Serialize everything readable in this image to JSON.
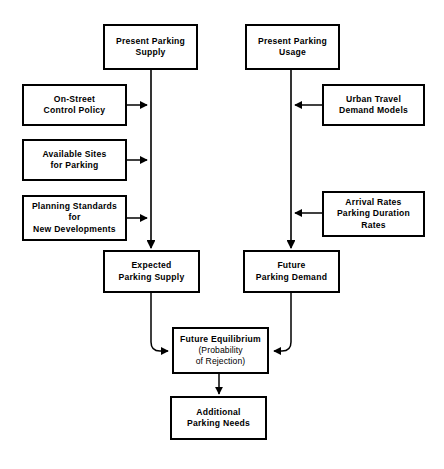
{
  "diagram": {
    "type": "flowchart",
    "background_color": "#ffffff",
    "line_color": "#000000",
    "text_color": "#000000",
    "nodes": [
      {
        "id": "present-parking-supply",
        "lines": [
          "Present Parking",
          "Supply"
        ],
        "x": 103,
        "y": 24,
        "w": 95,
        "h": 46
      },
      {
        "id": "present-parking-usage",
        "lines": [
          "Present Parking",
          "Usage"
        ],
        "x": 245,
        "y": 24,
        "w": 95,
        "h": 46
      },
      {
        "id": "on-street-control-policy",
        "lines": [
          "On-Street",
          "Control  Policy"
        ],
        "x": 22,
        "y": 84,
        "w": 105,
        "h": 42
      },
      {
        "id": "urban-travel-demand-models",
        "lines": [
          "Urban Travel",
          "Demand Models"
        ],
        "x": 322,
        "y": 84,
        "w": 103,
        "h": 42
      },
      {
        "id": "available-sites-for-parking",
        "lines": [
          "Available  Sites",
          "for Parking"
        ],
        "x": 22,
        "y": 139,
        "w": 105,
        "h": 42
      },
      {
        "id": "arrival-rates",
        "lines": [
          "Arrival Rates",
          "Parking Duration",
          "Rates"
        ],
        "x": 322,
        "y": 191,
        "w": 103,
        "h": 46
      },
      {
        "id": "planning-standards",
        "lines": [
          "Planning Standards",
          "for",
          "New Developments"
        ],
        "x": 22,
        "y": 195,
        "w": 105,
        "h": 46
      },
      {
        "id": "expected-parking-supply",
        "lines": [
          "Expected",
          "Parking  Supply"
        ],
        "x": 103,
        "y": 250,
        "w": 97,
        "h": 43
      },
      {
        "id": "future-parking-demand",
        "lines": [
          "Future",
          "Parking  Demand"
        ],
        "x": 243,
        "y": 250,
        "w": 97,
        "h": 43
      },
      {
        "id": "future-equilibrium",
        "lines": [
          "Future Equilibrium",
          "(Probability",
          "of Rejection)"
        ],
        "line_styles": [
          "bold",
          "light",
          "light"
        ],
        "x": 172,
        "y": 327,
        "w": 97,
        "h": 47
      },
      {
        "id": "additional-parking-needs",
        "lines": [
          "Additional",
          "Parking Needs"
        ],
        "x": 170,
        "y": 396,
        "w": 97,
        "h": 44
      }
    ],
    "edges": [
      {
        "id": "supply-spine",
        "from": "present-parking-supply",
        "to": "expected-parking-supply",
        "kind": "vertical-arrow"
      },
      {
        "id": "usage-spine",
        "from": "present-parking-usage",
        "to": "future-parking-demand",
        "kind": "vertical-arrow"
      },
      {
        "id": "control-policy-to-spine",
        "from": "on-street-control-policy",
        "to": "supply-spine",
        "kind": "horizontal-arrow-right"
      },
      {
        "id": "available-sites-to-spine",
        "from": "available-sites-for-parking",
        "to": "supply-spine",
        "kind": "horizontal-arrow-right"
      },
      {
        "id": "planning-standards-to-spine",
        "from": "planning-standards",
        "to": "supply-spine",
        "kind": "horizontal-arrow-right"
      },
      {
        "id": "travel-models-to-spine",
        "from": "urban-travel-demand-models",
        "to": "usage-spine",
        "kind": "horizontal-arrow-left"
      },
      {
        "id": "arrival-rates-to-spine",
        "from": "arrival-rates",
        "to": "usage-spine",
        "kind": "horizontal-arrow-left"
      },
      {
        "id": "expected-supply-to-equilibrium",
        "from": "expected-parking-supply",
        "to": "future-equilibrium",
        "kind": "elbow-curve-right"
      },
      {
        "id": "future-demand-to-equilibrium",
        "from": "future-parking-demand",
        "to": "future-equilibrium",
        "kind": "elbow-curve-left"
      },
      {
        "id": "equilibrium-to-needs",
        "from": "future-equilibrium",
        "to": "additional-parking-needs",
        "kind": "vertical-arrow"
      }
    ]
  }
}
